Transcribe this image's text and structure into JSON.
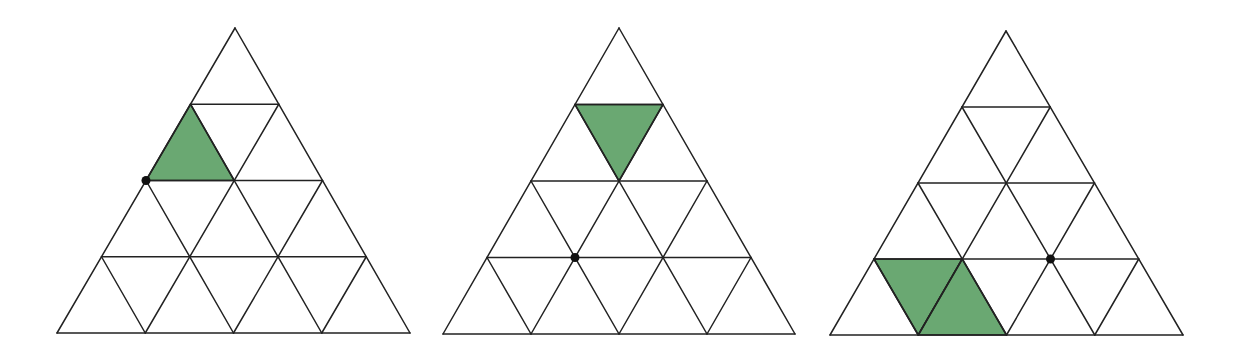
{
  "diagram": {
    "type": "triangular-grid-puzzle",
    "rows_per_triangle": 4,
    "colors": {
      "line": "#222222",
      "shade": "#6aa872",
      "dot": "#111111",
      "background": "#ffffff"
    },
    "panels": [
      {
        "id": "panel-1",
        "apex": [
          235,
          28
        ],
        "bottom_left": [
          57,
          333
        ],
        "bottom_right": [
          410,
          333
        ],
        "shaded_cells": [
          {
            "row": 1,
            "index": 0,
            "orientation": "up"
          }
        ],
        "dot": {
          "row": 2,
          "vertex": 0
        }
      },
      {
        "id": "panel-2",
        "apex": [
          619,
          28
        ],
        "bottom_left": [
          443,
          334
        ],
        "bottom_right": [
          795,
          334
        ],
        "shaded_cells": [
          {
            "row": 1,
            "index": 0,
            "orientation": "down"
          }
        ],
        "dot": {
          "row": 3,
          "vertex": 1
        }
      },
      {
        "id": "panel-3",
        "apex": [
          1006,
          31
        ],
        "bottom_left": [
          830,
          335
        ],
        "bottom_right": [
          1183,
          335
        ],
        "shaded_cells": [
          {
            "row": 3,
            "index": 0,
            "orientation": "down"
          },
          {
            "row": 3,
            "index": 1,
            "orientation": "up"
          }
        ],
        "dot": {
          "row": 3,
          "vertex": 2
        }
      }
    ]
  }
}
